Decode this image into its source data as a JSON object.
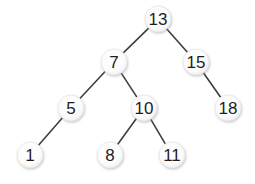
{
  "diagram": {
    "type": "binary-search-tree",
    "colors": {
      "edge": "#3f3f3f",
      "node_fill": "#ffffff",
      "node_shadow": "#bdbdbd",
      "label": "#1e1e1e",
      "background": "#ffffff"
    },
    "nodes": [
      {
        "id": "n13",
        "label": "13",
        "x": 158,
        "y": 19
      },
      {
        "id": "n7",
        "label": "7",
        "x": 114,
        "y": 62
      },
      {
        "id": "n15",
        "label": "15",
        "x": 196,
        "y": 62
      },
      {
        "id": "n5",
        "label": "5",
        "x": 71,
        "y": 108
      },
      {
        "id": "n10",
        "label": "10",
        "x": 144,
        "y": 108
      },
      {
        "id": "n18",
        "label": "18",
        "x": 228,
        "y": 108
      },
      {
        "id": "n1",
        "label": "1",
        "x": 30,
        "y": 155
      },
      {
        "id": "n8",
        "label": "8",
        "x": 110,
        "y": 155
      },
      {
        "id": "n11",
        "label": "11",
        "x": 172,
        "y": 155
      }
    ],
    "edges": [
      {
        "from": "n13",
        "to": "n7"
      },
      {
        "from": "n13",
        "to": "n15"
      },
      {
        "from": "n7",
        "to": "n5"
      },
      {
        "from": "n7",
        "to": "n10"
      },
      {
        "from": "n15",
        "to": "n18"
      },
      {
        "from": "n5",
        "to": "n1"
      },
      {
        "from": "n10",
        "to": "n8"
      },
      {
        "from": "n10",
        "to": "n11"
      }
    ]
  }
}
